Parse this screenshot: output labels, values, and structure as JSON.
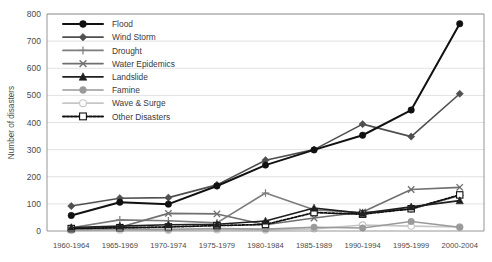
{
  "chart_data": {
    "type": "line",
    "title": "",
    "subtitle": "",
    "xlabel": "",
    "ylabel": "Number of disasters",
    "ylim": [
      0,
      800
    ],
    "ytick_step": 100,
    "yticks": [
      "0",
      "100",
      "200",
      "300",
      "400",
      "500",
      "600",
      "700",
      "800"
    ],
    "grid": true,
    "legend_position": "top-left-inside",
    "categories": [
      "1960-1964",
      "1965-1969",
      "1970-1974",
      "1975-1979",
      "1980-1984",
      "1985-1989",
      "1990-1994",
      "1995-1999",
      "2000-2004"
    ],
    "series": [
      {
        "name": "Flood",
        "color": "#111111",
        "marker": "circle",
        "dash": "none",
        "values": [
          57,
          106,
          99,
          166,
          243,
          299,
          353,
          446,
          764
        ]
      },
      {
        "name": "Wind Storm",
        "color": "#4f4f4f",
        "marker": "diamond",
        "dash": "none",
        "values": [
          92,
          121,
          123,
          170,
          261,
          300,
          394,
          348,
          506
        ]
      },
      {
        "name": "Drought",
        "color": "#7d7d7d",
        "marker": "plus",
        "dash": "none",
        "values": [
          12,
          41,
          38,
          30,
          140,
          78,
          68,
          80,
          131
        ]
      },
      {
        "name": "Water Epidemics",
        "color": "#707070",
        "marker": "x",
        "dash": "none",
        "values": [
          10,
          14,
          65,
          63,
          23,
          48,
          70,
          153,
          161
        ]
      },
      {
        "name": "Landslide",
        "color": "#1f1f1f",
        "marker": "triangle",
        "dash": "none",
        "values": [
          13,
          18,
          23,
          25,
          37,
          85,
          65,
          89,
          112
        ]
      },
      {
        "name": "Famine",
        "color": "#9a9a9a",
        "marker": "circle",
        "dash": "none",
        "values": [
          5,
          8,
          6,
          9,
          7,
          14,
          11,
          35,
          14
        ]
      },
      {
        "name": "Wave & Surge",
        "color": "#c6c6c6",
        "marker": "circle-open",
        "dash": "none",
        "values": [
          2,
          4,
          3,
          5,
          4,
          8,
          22,
          18,
          15
        ]
      },
      {
        "name": "Other Disasters",
        "color": "#111111",
        "marker": "square-open",
        "dash": "dotted",
        "values": [
          9,
          12,
          15,
          20,
          24,
          68,
          62,
          82,
          133
        ]
      }
    ]
  },
  "axes": {
    "y_title": "Number of disasters"
  },
  "legend": {
    "entries": [
      {
        "label": "Flood"
      },
      {
        "label": "Wind Storm"
      },
      {
        "label": "Drought"
      },
      {
        "label": "Water Epidemics"
      },
      {
        "label": "Landslide"
      },
      {
        "label": "Famine"
      },
      {
        "label": "Wave & Surge"
      },
      {
        "label": "Other Disasters"
      }
    ]
  }
}
